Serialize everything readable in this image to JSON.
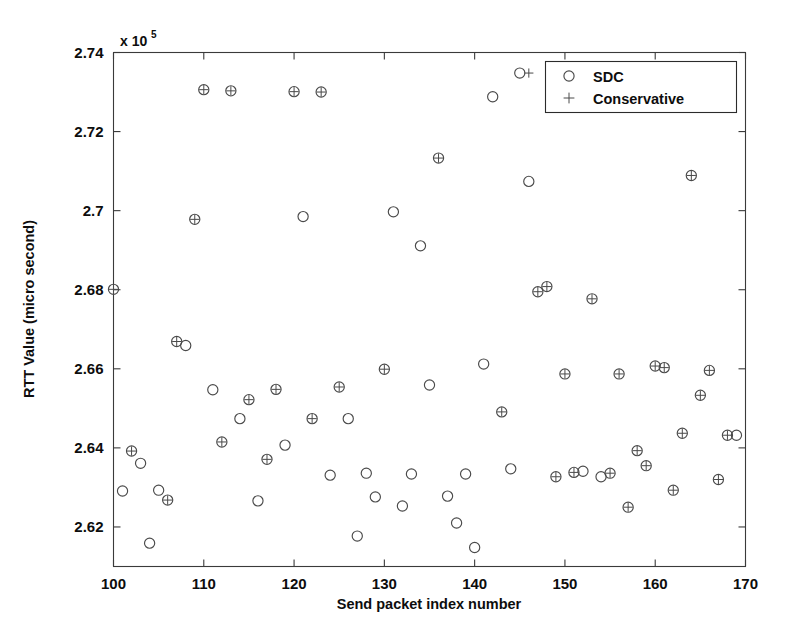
{
  "figure": {
    "background_color": "#ffffff",
    "axis_color": "#3a3a3a",
    "marker_color": "#4a4a4a",
    "text_color": "#0d0d0d"
  },
  "axes": {
    "y_exponent_prefix": "x 10",
    "y_exponent_power": "5",
    "x_title": "Send packet index number",
    "y_title": "RTT Value (micro second)",
    "x_ticks": [
      "100",
      "110",
      "120",
      "130",
      "140",
      "150",
      "160",
      "170"
    ],
    "y_ticks": [
      "2.62",
      "2.64",
      "2.66",
      "2.68",
      "2.7",
      "2.72",
      "2.74"
    ]
  },
  "legend": {
    "entries": [
      {
        "label": "SDC",
        "marker": "circle-icon"
      },
      {
        "label": "Conservative",
        "marker": "plus-icon"
      }
    ]
  },
  "chart_data": {
    "type": "scatter",
    "title": "",
    "xlabel": "Send packet index number",
    "ylabel": "RTT Value (micro second)",
    "y_scale_factor": 100000,
    "xlim": [
      100,
      170
    ],
    "ylim": [
      2.61,
      2.74
    ],
    "xticks": [
      100,
      110,
      120,
      130,
      140,
      150,
      160,
      170
    ],
    "yticks": [
      2.62,
      2.64,
      2.66,
      2.68,
      2.7,
      2.72,
      2.74
    ],
    "grid": false,
    "legend_position": "top-right",
    "series": [
      {
        "name": "SDC",
        "marker": "circle",
        "x": [
          100,
          101,
          102,
          103,
          104,
          105,
          106,
          107,
          108,
          109,
          110,
          111,
          112,
          113,
          114,
          115,
          116,
          117,
          118,
          119,
          120,
          121,
          122,
          123,
          124,
          125,
          126,
          127,
          128,
          129,
          130,
          131,
          132,
          133,
          134,
          135,
          136,
          137,
          138,
          139,
          140,
          141,
          142,
          143,
          144,
          145,
          146,
          147,
          148,
          149,
          150,
          151,
          152,
          153,
          154,
          155,
          156,
          157,
          158,
          159,
          160,
          161,
          162,
          163,
          164,
          165,
          166,
          167,
          168,
          169
        ],
        "y": [
          2.6801,
          2.6291,
          2.6392,
          2.6361,
          2.6159,
          2.6293,
          2.6268,
          2.6669,
          2.6659,
          2.6978,
          2.7306,
          2.6547,
          2.6415,
          2.7303,
          2.6474,
          2.6522,
          2.6266,
          2.6371,
          2.6548,
          2.6407,
          2.7301,
          2.6985,
          2.6474,
          2.73,
          2.6331,
          2.6554,
          2.6474,
          2.6177,
          2.6336,
          2.6276,
          2.6599,
          2.6997,
          2.6253,
          2.6334,
          2.6911,
          2.6559,
          2.7133,
          2.6278,
          2.621,
          2.6334,
          2.6148,
          2.6612,
          2.7288,
          2.6491,
          2.6347,
          2.7348,
          2.7074,
          2.6795,
          2.6808,
          2.6327,
          2.6587,
          2.6338,
          2.6341,
          2.6777,
          2.6327,
          2.6336,
          2.6587,
          2.625,
          2.6393,
          2.6355,
          2.6607,
          2.6603,
          2.6293,
          2.6437,
          2.7089,
          2.6533,
          2.6596,
          2.632,
          2.6432,
          2.6432
        ]
      },
      {
        "name": "Conservative",
        "marker": "plus",
        "x": [
          100,
          102,
          106,
          107,
          109,
          110,
          112,
          113,
          115,
          117,
          118,
          120,
          122,
          123,
          125,
          130,
          136,
          143,
          146,
          147,
          148,
          149,
          150,
          151,
          153,
          155,
          156,
          157,
          158,
          159,
          160,
          161,
          162,
          163,
          164,
          165,
          166,
          167,
          168
        ],
        "y": [
          2.6801,
          2.6392,
          2.6268,
          2.6669,
          2.6978,
          2.7306,
          2.6415,
          2.7303,
          2.6522,
          2.6371,
          2.6548,
          2.7301,
          2.6474,
          2.73,
          2.6554,
          2.6599,
          2.7133,
          2.6491,
          2.7348,
          2.6795,
          2.6808,
          2.6327,
          2.6587,
          2.6338,
          2.6777,
          2.6336,
          2.6587,
          2.625,
          2.6393,
          2.6355,
          2.6607,
          2.6603,
          2.6293,
          2.6437,
          2.7089,
          2.6533,
          2.6596,
          2.632,
          2.6432
        ]
      }
    ]
  }
}
